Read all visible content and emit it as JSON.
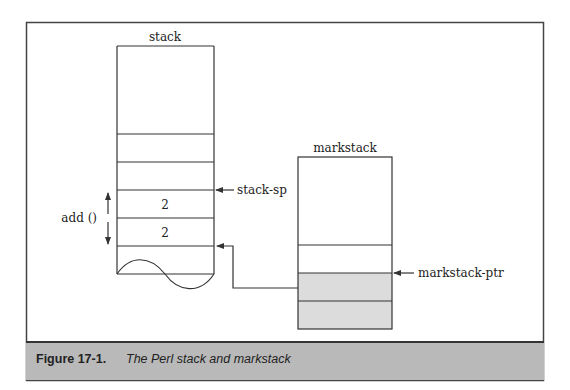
{
  "figure": {
    "number": "Figure 17-1.",
    "title": "The Perl stack and markstack"
  },
  "stack": {
    "label": "stack",
    "cells": [
      "",
      "",
      "",
      "2",
      "2",
      ""
    ],
    "pointer_label": "stack-sp",
    "span_label": "add ()"
  },
  "markstack": {
    "label": "markstack",
    "cells": [
      {
        "value": "",
        "shaded": false
      },
      {
        "value": "",
        "shaded": false
      },
      {
        "value": "",
        "shaded": true
      },
      {
        "value": "",
        "shaded": true
      }
    ],
    "pointer_label": "markstack-ptr"
  },
  "colors": {
    "line": "#333333",
    "shade": "#dcdcdc",
    "caption_bg": "#b9b9b9"
  }
}
